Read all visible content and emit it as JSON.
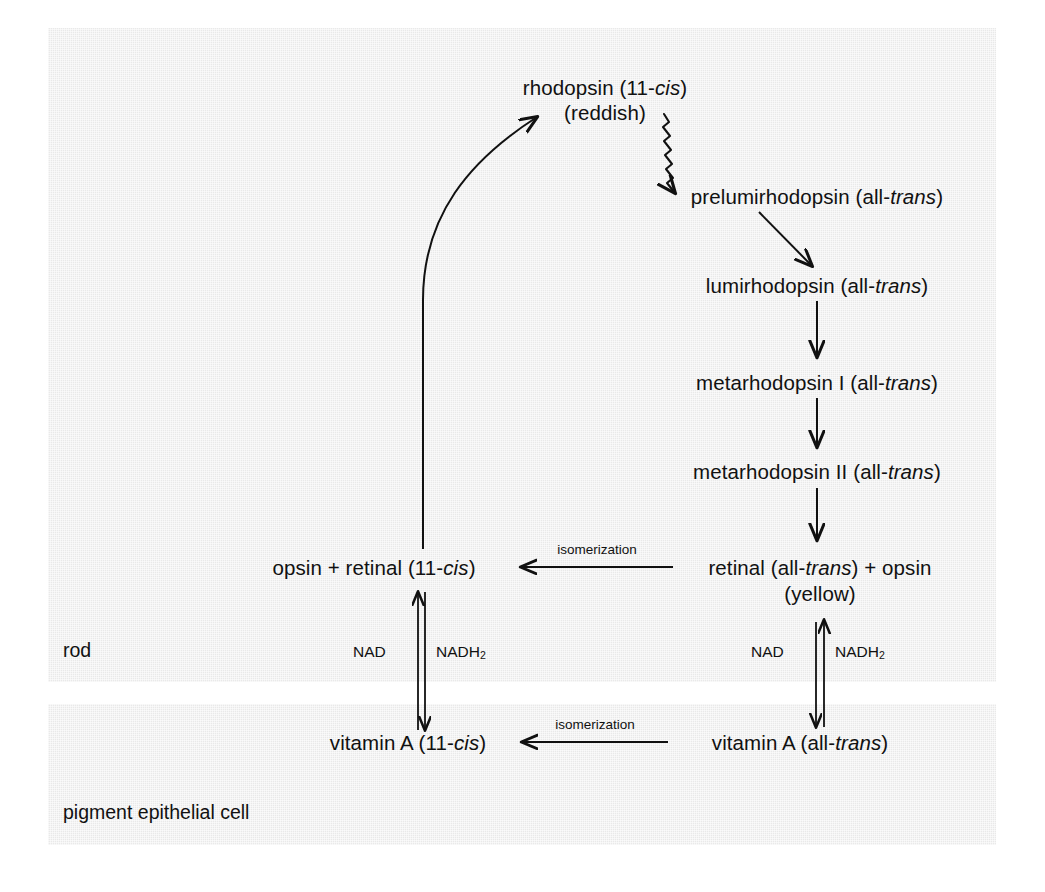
{
  "diagram": {
    "compartments": [
      {
        "id": "rod",
        "label": "rod"
      },
      {
        "id": "pigment_epithelial_cell",
        "label": "pigment epithelial cell"
      }
    ],
    "nodes": {
      "rhodopsin": {
        "line1_pre": "rhodopsin (11-",
        "line1_italic": "cis",
        "line1_post": ")",
        "line2": "(reddish)"
      },
      "prelumirhodopsin": {
        "pre": "prelumirhodopsin (all-",
        "italic": "trans",
        "post": ")"
      },
      "lumirhodopsin": {
        "pre": "lumirhodopsin (all-",
        "italic": "trans",
        "post": ")"
      },
      "metarhodopsin_i": {
        "pre": "metarhodopsin I (all-",
        "italic": "trans",
        "post": ")"
      },
      "metarhodopsin_ii": {
        "pre": "metarhodopsin II (all-",
        "italic": "trans",
        "post": ")"
      },
      "retinal_alltrans_opsin": {
        "pre": "retinal (all-",
        "italic": "trans",
        "post": ") + opsin",
        "line2": "(yellow)"
      },
      "opsin_retinal_11cis": {
        "pre": "opsin + retinal (11-",
        "italic": "cis",
        "post": ")"
      },
      "vitamin_a_alltrans": {
        "pre": "vitamin A (all-",
        "italic": "trans",
        "post": ")"
      },
      "vitamin_a_11cis": {
        "pre": "vitamin A (11-",
        "italic": "cis",
        "post": ")"
      }
    },
    "edge_labels": {
      "isomerization_retinal": "isomerization",
      "isomerization_vitamin_a": "isomerization"
    },
    "cofactors": {
      "left_nad": "NAD",
      "left_nadh2_pre": "NADH",
      "left_nadh2_sub": "2",
      "right_nad": "NAD",
      "right_nadh2_pre": "NADH",
      "right_nadh2_sub": "2"
    },
    "colors": {
      "background": "#ffffff",
      "compartment_fill": "#e9e9e9",
      "ink": "#111111"
    }
  }
}
